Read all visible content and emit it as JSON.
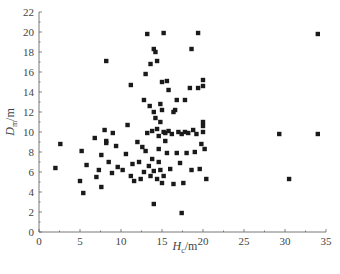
{
  "chart_data": {
    "type": "scatter",
    "title": "",
    "xlabel": "H_c/m",
    "ylabel": "D_m/m",
    "xlim": [
      0,
      35
    ],
    "ylim": [
      0,
      22
    ],
    "xticks": [
      0,
      5,
      10,
      15,
      20,
      25,
      30,
      35
    ],
    "yticks": [
      0,
      2,
      4,
      6,
      8,
      10,
      12,
      14,
      16,
      18,
      20,
      22
    ],
    "grid": false,
    "legend": null,
    "marker": "square",
    "color": "#1a1a1a",
    "series": [
      {
        "name": "points",
        "x": [
          2.0,
          2.6,
          5.0,
          5.2,
          5.4,
          5.8,
          6.8,
          7.0,
          7.3,
          7.6,
          7.6,
          8.0,
          8.2,
          8.2,
          8.5,
          8.9,
          9.0,
          9.4,
          9.6,
          10.2,
          10.6,
          10.8,
          11.2,
          11.4,
          11.6,
          12.0,
          12.2,
          12.4,
          12.6,
          12.8,
          13.0,
          13.2,
          13.4,
          13.5,
          13.6,
          13.8,
          13.8,
          14.0,
          14.0,
          14.2,
          14.4,
          14.4,
          14.6,
          14.6,
          14.8,
          14.8,
          15.0,
          15.0,
          15.2,
          15.2,
          15.4,
          15.6,
          15.6,
          15.8,
          16.0,
          16.2,
          16.4,
          16.6,
          16.8,
          17.0,
          17.2,
          17.4,
          17.6,
          17.8,
          18.0,
          18.2,
          18.4,
          18.6,
          18.8,
          19.0,
          19.2,
          19.4,
          19.6,
          19.8,
          20.0,
          20.0,
          20.0,
          20.0,
          20.0,
          20.2,
          20.4,
          13.2,
          14.0,
          15.2,
          18.6,
          19.4,
          13.0,
          14.2,
          15.0,
          16.8,
          12.8,
          14.4,
          15.8,
          17.8,
          13.6,
          14.8,
          16.4,
          14.0,
          14.6,
          15.4,
          17.4,
          8.2,
          11.2,
          29.3,
          34.0,
          34.0,
          30.5
        ],
        "y": [
          6.4,
          8.8,
          5.1,
          8.1,
          3.9,
          6.7,
          9.4,
          5.5,
          6.2,
          7.7,
          4.5,
          10.2,
          9.1,
          8.9,
          7.0,
          5.9,
          9.9,
          8.6,
          6.5,
          6.2,
          7.8,
          10.7,
          5.6,
          6.8,
          5.1,
          9.0,
          7.0,
          5.3,
          8.5,
          6.0,
          8.1,
          9.9,
          6.6,
          12.6,
          5.6,
          10.1,
          7.3,
          12.0,
          6.1,
          11.4,
          10.3,
          5.3,
          9.6,
          7.0,
          11.0,
          6.2,
          12.2,
          4.9,
          10.0,
          5.6,
          9.9,
          15.1,
          7.9,
          10.1,
          6.3,
          9.8,
          4.8,
          12.2,
          7.9,
          10.0,
          6.9,
          9.8,
          4.9,
          10.0,
          7.9,
          9.9,
          14.4,
          6.2,
          10.2,
          8.0,
          9.8,
          14.4,
          6.3,
          8.8,
          11.0,
          10.6,
          10.0,
          15.2,
          14.6,
          8.3,
          5.3,
          19.8,
          18.3,
          19.9,
          18.3,
          19.9,
          15.8,
          18.0,
          15.0,
          13.2,
          13.2,
          17.1,
          14.2,
          13.2,
          16.8,
          12.8,
          12.0,
          2.8,
          8.3,
          9.1,
          1.9,
          17.1,
          14.7,
          9.8,
          19.8,
          9.8,
          5.3
        ]
      }
    ]
  },
  "axes": {
    "x_title_main": "H",
    "x_title_sub": "c",
    "x_title_unit": "/m",
    "y_title_main": "D",
    "y_title_sub": "m",
    "y_title_unit": "/m"
  }
}
